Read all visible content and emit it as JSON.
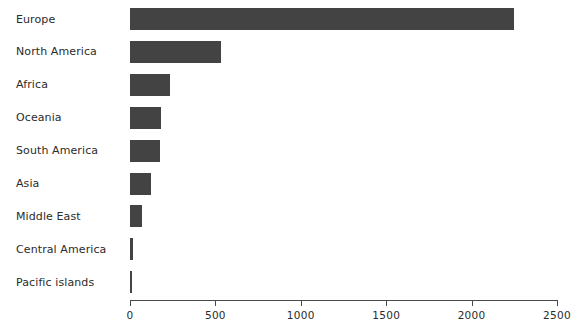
{
  "chart_data": {
    "type": "bar",
    "orientation": "horizontal",
    "title": "",
    "xlabel": "",
    "ylabel": "",
    "categories": [
      "Europe",
      "North America",
      "Africa",
      "Oceania",
      "South America",
      "Asia",
      "Middle East",
      "Central America",
      "Pacific islands"
    ],
    "values": [
      2250,
      530,
      235,
      180,
      175,
      125,
      70,
      18,
      8
    ],
    "xlim": [
      0,
      2500
    ],
    "xticks": [
      0,
      500,
      1000,
      1500,
      2000,
      2500
    ],
    "xtick_labels": [
      "0",
      "500",
      "1000",
      "1500",
      "2000",
      "2500"
    ],
    "grid": false,
    "legend": false,
    "bar_color": "#434343",
    "axis_color": "#4a4a4a",
    "text_color": "#2b2b2b",
    "background": "#ffffff"
  }
}
